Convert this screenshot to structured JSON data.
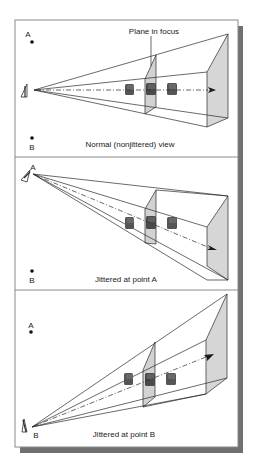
{
  "figure": {
    "colors": {
      "frame": "#7a7a7a",
      "shadow": "#6e6e6e",
      "plane_fill": "#d4d4d4",
      "line": "#2a2a2a",
      "cube_dark": "#4a4a4a",
      "cube_mid": "#6a6a6a"
    },
    "panels": [
      {
        "caption": "Normal (nonjittered) view",
        "point_a_label": "A",
        "point_b_label": "B",
        "callout": "Plane in focus",
        "eye_at": "left-center"
      },
      {
        "caption": "Jittered at point A",
        "point_a_label": "A",
        "point_b_label": "B",
        "eye_at": "A"
      },
      {
        "caption": "Jittered at point B",
        "point_a_label": "A",
        "point_b_label": "B",
        "eye_at": "B"
      }
    ],
    "icons": [
      "eye-icon",
      "cube-icon",
      "arrow-icon",
      "point-icon"
    ]
  }
}
